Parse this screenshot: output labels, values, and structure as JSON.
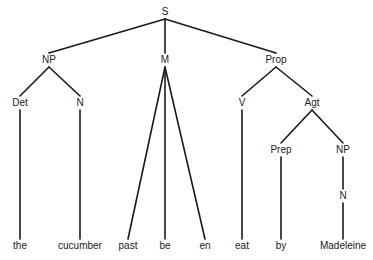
{
  "diagram": {
    "type": "syntax-tree",
    "nodes": {
      "S": {
        "label": "S",
        "x": 165,
        "y": 12
      },
      "NP1": {
        "label": "NP",
        "x": 49,
        "y": 60
      },
      "M": {
        "label": "M",
        "x": 165,
        "y": 60
      },
      "Prop": {
        "label": "Prop",
        "x": 276,
        "y": 60
      },
      "Det": {
        "label": "Det",
        "x": 20,
        "y": 103
      },
      "N1": {
        "label": "N",
        "x": 80,
        "y": 103
      },
      "V": {
        "label": "V",
        "x": 242,
        "y": 103
      },
      "Agt": {
        "label": "Agt",
        "x": 312,
        "y": 103
      },
      "Prep": {
        "label": "Prep",
        "x": 281,
        "y": 150
      },
      "NP2": {
        "label": "NP",
        "x": 343,
        "y": 150
      },
      "N2": {
        "label": "N",
        "x": 343,
        "y": 196
      },
      "the": {
        "label": "the",
        "x": 20,
        "y": 246
      },
      "cucumber": {
        "label": "cucumber",
        "x": 80,
        "y": 246
      },
      "past": {
        "label": "past",
        "x": 128,
        "y": 246
      },
      "be": {
        "label": "be",
        "x": 165,
        "y": 246
      },
      "en": {
        "label": "en",
        "x": 205,
        "y": 246
      },
      "eat": {
        "label": "eat",
        "x": 242,
        "y": 246
      },
      "by": {
        "label": "by",
        "x": 281,
        "y": 246
      },
      "Madeleine": {
        "label": "Madeleine",
        "x": 343,
        "y": 246
      }
    },
    "edges": [
      [
        "S",
        "NP1"
      ],
      [
        "S",
        "M"
      ],
      [
        "S",
        "Prop"
      ],
      [
        "NP1",
        "Det"
      ],
      [
        "NP1",
        "N1"
      ],
      [
        "M",
        "past"
      ],
      [
        "M",
        "be"
      ],
      [
        "M",
        "en"
      ],
      [
        "Prop",
        "V"
      ],
      [
        "Prop",
        "Agt"
      ],
      [
        "Det",
        "the"
      ],
      [
        "N1",
        "cucumber"
      ],
      [
        "V",
        "eat"
      ],
      [
        "Agt",
        "Prep"
      ],
      [
        "Agt",
        "NP2"
      ],
      [
        "Prep",
        "by"
      ],
      [
        "NP2",
        "N2"
      ],
      [
        "N2",
        "Madeleine"
      ]
    ],
    "colors": {
      "line": "#1a1a1a",
      "text": "#222222",
      "background": "#ffffff"
    }
  }
}
